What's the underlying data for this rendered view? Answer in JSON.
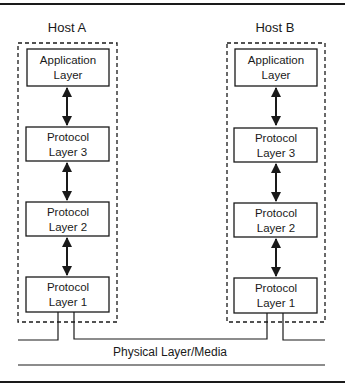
{
  "diagram": {
    "type": "protocol-stack",
    "hosts": [
      {
        "id": "host-a",
        "label": "Host A",
        "layers": [
          {
            "line1": "Application",
            "line2": "Layer"
          },
          {
            "line1": "Protocol",
            "line2": "Layer 3"
          },
          {
            "line1": "Protocol",
            "line2": "Layer 2"
          },
          {
            "line1": "Protocol",
            "line2": "Layer 1"
          }
        ]
      },
      {
        "id": "host-b",
        "label": "Host B",
        "layers": [
          {
            "line1": "Application",
            "line2": "Layer"
          },
          {
            "line1": "Protocol",
            "line2": "Layer 3"
          },
          {
            "line1": "Protocol",
            "line2": "Layer 2"
          },
          {
            "line1": "Protocol",
            "line2": "Layer 1"
          }
        ]
      }
    ],
    "media_label": "Physical Layer/Media",
    "connections": "bidirectional arrows between adjacent layers in each host; Layer 1 of both hosts attached to shared physical media",
    "colors": {
      "line": "#1a1a1a",
      "background": "#ffffff"
    }
  }
}
